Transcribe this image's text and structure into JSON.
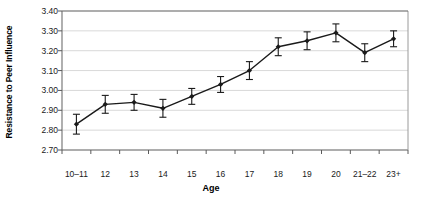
{
  "chart_data": {
    "type": "line",
    "title": "",
    "xlabel": "Age",
    "ylabel": "Resistance to Peer Influence",
    "categories": [
      "10–11",
      "12",
      "13",
      "14",
      "15",
      "16",
      "17",
      "18",
      "19",
      "20",
      "21–22",
      "23+"
    ],
    "values": [
      2.83,
      2.93,
      2.94,
      2.91,
      2.97,
      3.03,
      3.1,
      3.22,
      3.25,
      3.29,
      3.19,
      3.26
    ],
    "errors": [
      0.05,
      0.045,
      0.04,
      0.045,
      0.04,
      0.04,
      0.045,
      0.045,
      0.045,
      0.045,
      0.045,
      0.04
    ],
    "ylim": [
      2.7,
      3.4
    ],
    "yticks": [
      "2.70",
      "2.80",
      "2.90",
      "3.00",
      "3.10",
      "3.20",
      "3.30",
      "3.40"
    ],
    "ytick_values": [
      2.7,
      2.8,
      2.9,
      3.0,
      3.1,
      3.2,
      3.3,
      3.4
    ],
    "grid": true,
    "legend": "none",
    "marker": "diamond",
    "series_color": "#1a1a1a",
    "grid_color": "#d9d9d9",
    "axis_color": "#7a7a7a"
  }
}
